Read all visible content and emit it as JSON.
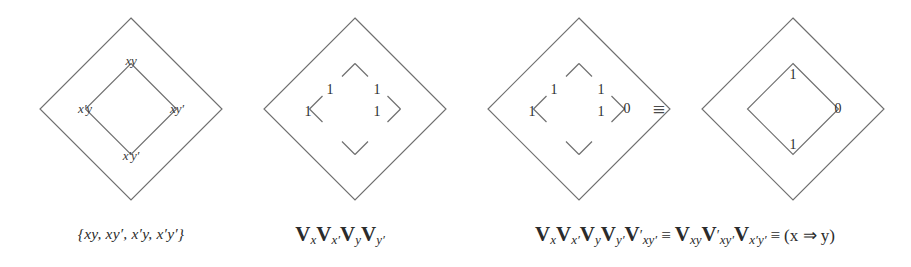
{
  "figure": {
    "background": "#ffffff",
    "line_color": "#6f6f6f",
    "text_color": "#2b2b2b",
    "equiv_symbol": "≡",
    "implies_symbol": "⇒"
  },
  "diagrams": [
    {
      "id": "diagram-1",
      "name": "minterm-diamond",
      "cells": {
        "top": "xy",
        "left": "x′y",
        "right": "xy′",
        "bottom": "x′y′"
      },
      "inner_square_style": "solid",
      "outer_right_label": "",
      "caption": "{xy, xy′, x′y, x′y′}"
    },
    {
      "id": "diagram-2",
      "name": "all-ones-diamond",
      "cells": {
        "top": "1",
        "left": "1",
        "right": "1",
        "bottom": "1"
      },
      "inner_square_style": "stubs",
      "outer_right_label": "",
      "caption_parts": [
        {
          "v": "V",
          "sub": "x",
          "prime": ""
        },
        {
          "v": "V",
          "sub": "x",
          "prime": "′"
        },
        {
          "v": "V",
          "sub": "y",
          "prime": ""
        },
        {
          "v": "V",
          "sub": "y",
          "prime": "′"
        }
      ],
      "caption_text": "VxVx′VyVy′"
    },
    {
      "id": "diagram-3",
      "name": "ones-with-zero-diamond",
      "cells": {
        "top": "1",
        "left": "1",
        "right": "1",
        "bottom": "1"
      },
      "inner_square_style": "stubs",
      "outer_right_label": "0",
      "caption": ""
    },
    {
      "id": "diagram-4",
      "name": "reduced-implication-diamond",
      "cells": {
        "top": "1",
        "left": "",
        "right": "0",
        "bottom": "1"
      },
      "inner_square_style": "solid",
      "outer_right_label": "",
      "caption": ""
    }
  ],
  "captions": {
    "caption_1": "{xy, xy′, x′y, x′y′}",
    "caption_2_segments": [
      {
        "v": "V",
        "sub": "x"
      },
      {
        "v": "V",
        "sub": "x′"
      },
      {
        "v": "V",
        "sub": "y"
      },
      {
        "v": "V",
        "sub": "y′"
      }
    ],
    "caption_3_segments": [
      {
        "type": "v",
        "v": "V",
        "prime": "",
        "sub": "x"
      },
      {
        "type": "v",
        "v": "V",
        "prime": "",
        "sub": "x′"
      },
      {
        "type": "v",
        "v": "V",
        "prime": "",
        "sub": "y"
      },
      {
        "type": "v",
        "v": "V",
        "prime": "",
        "sub": "y′"
      },
      {
        "type": "v",
        "v": "V",
        "prime": "′",
        "sub": "xy′"
      },
      {
        "type": "op",
        "text": "≡"
      },
      {
        "type": "v",
        "v": "V",
        "prime": "",
        "sub": "xy"
      },
      {
        "type": "v",
        "v": "V",
        "prime": "′",
        "sub": "xy′"
      },
      {
        "type": "v",
        "v": "V",
        "prime": "",
        "sub": "x′y′"
      },
      {
        "type": "op",
        "text": "≡"
      },
      {
        "type": "plain",
        "text": "(x ⇒ y)"
      }
    ],
    "caption_3_text": "VxVx′VyVy′V′xy′ ≡ VxyV′xy′Vx′y′ ≡ (x ⇒ y)"
  },
  "between_equiv": "≡"
}
